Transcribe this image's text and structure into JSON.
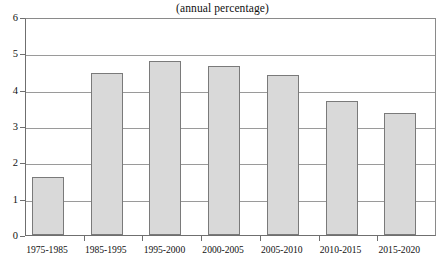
{
  "chart_data": {
    "type": "bar",
    "title": "(annual percentage)",
    "xlabel": "",
    "ylabel": "",
    "categories": [
      "1975-1985",
      "1985-1995",
      "1995-2000",
      "2000-2005",
      "2005-2010",
      "2010-2015",
      "2015-2020"
    ],
    "values": [
      1.6,
      4.45,
      4.8,
      4.65,
      4.4,
      3.68,
      3.35
    ],
    "ylim": [
      0,
      6
    ],
    "yticks": [
      "0",
      "1",
      "2",
      "3",
      "4",
      "5",
      "6"
    ],
    "ytick_values": [
      0,
      1,
      2,
      3,
      4,
      5,
      6
    ],
    "grid": true,
    "legend": false,
    "bar_fill_color": "#d9d9d9",
    "bar_border_color": "#7a7a7a",
    "gridline_color": "#9a9a9a",
    "axis_color": "#6f6f6f",
    "background_color": "#ffffff"
  }
}
